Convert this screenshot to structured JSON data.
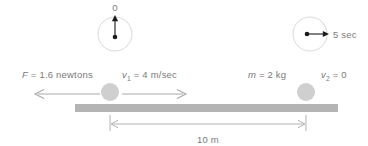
{
  "figure": {
    "background_color": "#ffffff"
  },
  "clocks": [
    {
      "name": "start-clock",
      "label": "0",
      "hand_direction": "up",
      "cx": 115,
      "cy": 34,
      "r": 17
    },
    {
      "name": "end-clock",
      "label": "5 sec",
      "hand_direction": "right",
      "cx": 310,
      "cy": 34,
      "r": 17
    }
  ],
  "labels": {
    "force": {
      "symbol": "F",
      "rest": " = 1.6 newtons"
    },
    "velocity_1": {
      "symbol": "v",
      "sub": "1",
      "rest": " = 4 m/sec"
    },
    "mass": {
      "symbol": "m",
      "rest": " = 2 kg"
    },
    "velocity_2": {
      "symbol": "v",
      "sub": "2",
      "rest": " = 0"
    },
    "distance": "10 m"
  },
  "arrows": {
    "force_arrow": {
      "direction": "left",
      "x_from": 100,
      "x_to": 35,
      "y": 94
    },
    "velocity_arrow": {
      "direction": "right",
      "x_from": 122,
      "x_to": 186,
      "y": 94
    }
  },
  "balls": [
    {
      "name": "ball-left",
      "cx": 110,
      "cy": 92,
      "r": 9
    },
    {
      "name": "ball-right",
      "cx": 306,
      "cy": 92,
      "r": 9
    }
  ],
  "bar": {
    "x": 75,
    "y": 104,
    "width": 263,
    "height": 8
  },
  "dimension": {
    "x_from": 110,
    "x_to": 306,
    "y": 124
  },
  "colors": {
    "ball": "#cfcfcf",
    "bar": "#b4b4b4",
    "text": "#7a7a7a",
    "arrow": "#a8a8a8",
    "clock_outline": "#d8d8d8",
    "clock_hand": "#1b1b1b"
  }
}
